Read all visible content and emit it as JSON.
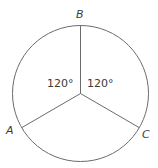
{
  "diagram": {
    "type": "circle-with-radii",
    "points": [
      {
        "label": "B",
        "x": 80,
        "y": 25
      },
      {
        "label": "A",
        "x": 22,
        "y": 128
      },
      {
        "label": "C",
        "x": 139,
        "y": 127
      }
    ],
    "center": {
      "x": 80,
      "y": 94
    },
    "radius": 68,
    "angles": [
      {
        "label": "120°",
        "between": "A-B"
      },
      {
        "label": "120°",
        "between": "B-C"
      }
    ],
    "colors": {
      "stroke": "#6b6b6b",
      "text": "#3a3a3a"
    }
  }
}
